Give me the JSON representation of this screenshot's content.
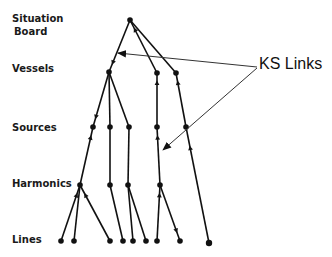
{
  "levels": {
    "situation_board_line1": "Situation",
    "situation_board_line2": "Board",
    "vessels": "Vessels",
    "sources": "Sources",
    "harmonics": "Harmonics",
    "lines": "Lines"
  },
  "annotation": {
    "ks_links": "KS Links"
  },
  "tree": {
    "nodes": [
      {
        "id": "sb",
        "level": "Situation Board"
      },
      {
        "id": "v1",
        "level": "Vessels"
      },
      {
        "id": "v2",
        "level": "Vessels"
      },
      {
        "id": "v3",
        "level": "Vessels"
      },
      {
        "id": "s1",
        "level": "Sources"
      },
      {
        "id": "s2",
        "level": "Sources"
      },
      {
        "id": "s3",
        "level": "Sources"
      },
      {
        "id": "s4",
        "level": "Sources"
      },
      {
        "id": "s5",
        "level": "Sources"
      },
      {
        "id": "h1",
        "level": "Harmonics"
      },
      {
        "id": "h2",
        "level": "Harmonics"
      },
      {
        "id": "h3",
        "level": "Harmonics"
      },
      {
        "id": "h4",
        "level": "Harmonics"
      },
      {
        "id": "l1",
        "level": "Lines"
      },
      {
        "id": "l2",
        "level": "Lines"
      },
      {
        "id": "l3",
        "level": "Lines"
      },
      {
        "id": "l4",
        "level": "Lines"
      },
      {
        "id": "l5",
        "level": "Lines"
      },
      {
        "id": "l6",
        "level": "Lines"
      },
      {
        "id": "l7",
        "level": "Lines"
      },
      {
        "id": "l8",
        "level": "Lines"
      },
      {
        "id": "l9",
        "level": "Lines"
      }
    ],
    "edges": [
      {
        "from": "sb",
        "to": "v1",
        "arrow": "down"
      },
      {
        "from": "sb",
        "to": "v2",
        "arrow": "up"
      },
      {
        "from": "sb",
        "to": "v3",
        "arrow": "none"
      },
      {
        "from": "v1",
        "to": "s1",
        "arrow": "down"
      },
      {
        "from": "v1",
        "to": "s2",
        "arrow": "none"
      },
      {
        "from": "v1",
        "to": "s3",
        "arrow": "none"
      },
      {
        "from": "v2",
        "to": "s4",
        "arrow": "up"
      },
      {
        "from": "v3",
        "to": "s5",
        "arrow": "up"
      },
      {
        "from": "s1",
        "to": "h1",
        "arrow": "up"
      },
      {
        "from": "s2",
        "to": "h2",
        "arrow": "none"
      },
      {
        "from": "s3",
        "to": "h3",
        "arrow": "none"
      },
      {
        "from": "s4",
        "to": "h4",
        "arrow": "up"
      },
      {
        "from": "s5",
        "to": "l9",
        "arrow": "up"
      },
      {
        "from": "h1",
        "to": "l1",
        "arrow": "up"
      },
      {
        "from": "h1",
        "to": "l2",
        "arrow": "none"
      },
      {
        "from": "h1",
        "to": "l3",
        "arrow": "up"
      },
      {
        "from": "h2",
        "to": "l4",
        "arrow": "none"
      },
      {
        "from": "h3",
        "to": "l5",
        "arrow": "none"
      },
      {
        "from": "h3",
        "to": "l6",
        "arrow": "none"
      },
      {
        "from": "h4",
        "to": "l7",
        "arrow": "up"
      },
      {
        "from": "h4",
        "to": "l8",
        "arrow": "down"
      }
    ]
  }
}
